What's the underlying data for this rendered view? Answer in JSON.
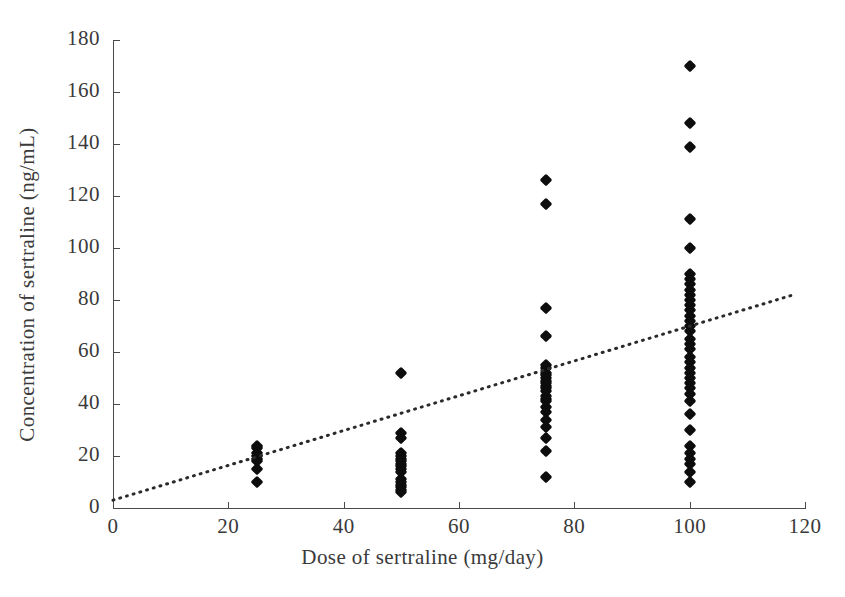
{
  "chart_data": {
    "type": "scatter",
    "title": "",
    "xlabel": "Dose of sertraline (mg/day)",
    "ylabel": "Concentration of sertraline (ng/mL)",
    "xlim": [
      0,
      120
    ],
    "ylim": [
      0,
      180
    ],
    "xticks": [
      0,
      20,
      40,
      60,
      80,
      100,
      120
    ],
    "yticks": [
      0,
      20,
      40,
      60,
      80,
      100,
      120,
      140,
      160,
      180
    ],
    "grid": false,
    "legend": null,
    "marker": "diamond",
    "marker_color": "#0d0d0d",
    "axis_color": "#4a4a4a",
    "background": "#ffffff",
    "series": [
      {
        "name": "Sertraline plasma concentration",
        "points": [
          [
            25,
            24
          ],
          [
            25,
            23
          ],
          [
            25,
            21
          ],
          [
            25,
            20
          ],
          [
            25,
            19
          ],
          [
            25,
            18
          ],
          [
            25,
            15
          ],
          [
            25,
            10
          ],
          [
            50,
            52
          ],
          [
            50,
            29
          ],
          [
            50,
            27
          ],
          [
            50,
            21
          ],
          [
            50,
            20
          ],
          [
            50,
            19
          ],
          [
            50,
            18
          ],
          [
            50,
            17
          ],
          [
            50,
            16
          ],
          [
            50,
            15
          ],
          [
            50,
            14
          ],
          [
            50,
            11
          ],
          [
            50,
            10
          ],
          [
            50,
            9
          ],
          [
            50,
            8
          ],
          [
            50,
            7
          ],
          [
            50,
            6
          ],
          [
            75,
            126
          ],
          [
            75,
            117
          ],
          [
            75,
            77
          ],
          [
            75,
            66
          ],
          [
            75,
            55
          ],
          [
            75,
            54
          ],
          [
            75,
            52
          ],
          [
            75,
            51
          ],
          [
            75,
            50
          ],
          [
            75,
            49
          ],
          [
            75,
            48
          ],
          [
            75,
            47
          ],
          [
            75,
            46
          ],
          [
            75,
            45
          ],
          [
            75,
            43
          ],
          [
            75,
            42
          ],
          [
            75,
            41
          ],
          [
            75,
            39
          ],
          [
            75,
            37
          ],
          [
            75,
            34
          ],
          [
            75,
            31
          ],
          [
            75,
            27
          ],
          [
            75,
            22
          ],
          [
            75,
            12
          ],
          [
            100,
            170
          ],
          [
            100,
            148
          ],
          [
            100,
            139
          ],
          [
            100,
            111
          ],
          [
            100,
            100
          ],
          [
            100,
            90
          ],
          [
            100,
            88
          ],
          [
            100,
            86
          ],
          [
            100,
            84
          ],
          [
            100,
            82
          ],
          [
            100,
            80
          ],
          [
            100,
            78
          ],
          [
            100,
            76
          ],
          [
            100,
            74
          ],
          [
            100,
            72
          ],
          [
            100,
            70
          ],
          [
            100,
            68
          ],
          [
            100,
            65
          ],
          [
            100,
            63
          ],
          [
            100,
            61
          ],
          [
            100,
            58
          ],
          [
            100,
            56
          ],
          [
            100,
            54
          ],
          [
            100,
            52
          ],
          [
            100,
            50
          ],
          [
            100,
            48
          ],
          [
            100,
            46
          ],
          [
            100,
            44
          ],
          [
            100,
            41
          ],
          [
            100,
            36
          ],
          [
            100,
            30
          ],
          [
            100,
            24
          ],
          [
            100,
            21
          ],
          [
            100,
            19
          ],
          [
            100,
            17
          ],
          [
            100,
            14
          ],
          [
            100,
            10
          ]
        ]
      }
    ],
    "trend_line": {
      "style": "dotted",
      "color": "#2a2a2a",
      "x_start": 0,
      "y_start": 3,
      "x_end": 118,
      "y_end": 82
    }
  },
  "axes": {
    "x": {
      "title": "Dose of sertraline (mg/day)",
      "tick_labels": [
        "0",
        "20",
        "40",
        "60",
        "80",
        "100",
        "120"
      ]
    },
    "y": {
      "title": "Concentration of sertraline (ng/mL)",
      "tick_labels": [
        "0",
        "20",
        "40",
        "60",
        "80",
        "100",
        "120",
        "140",
        "160",
        "180"
      ]
    }
  }
}
